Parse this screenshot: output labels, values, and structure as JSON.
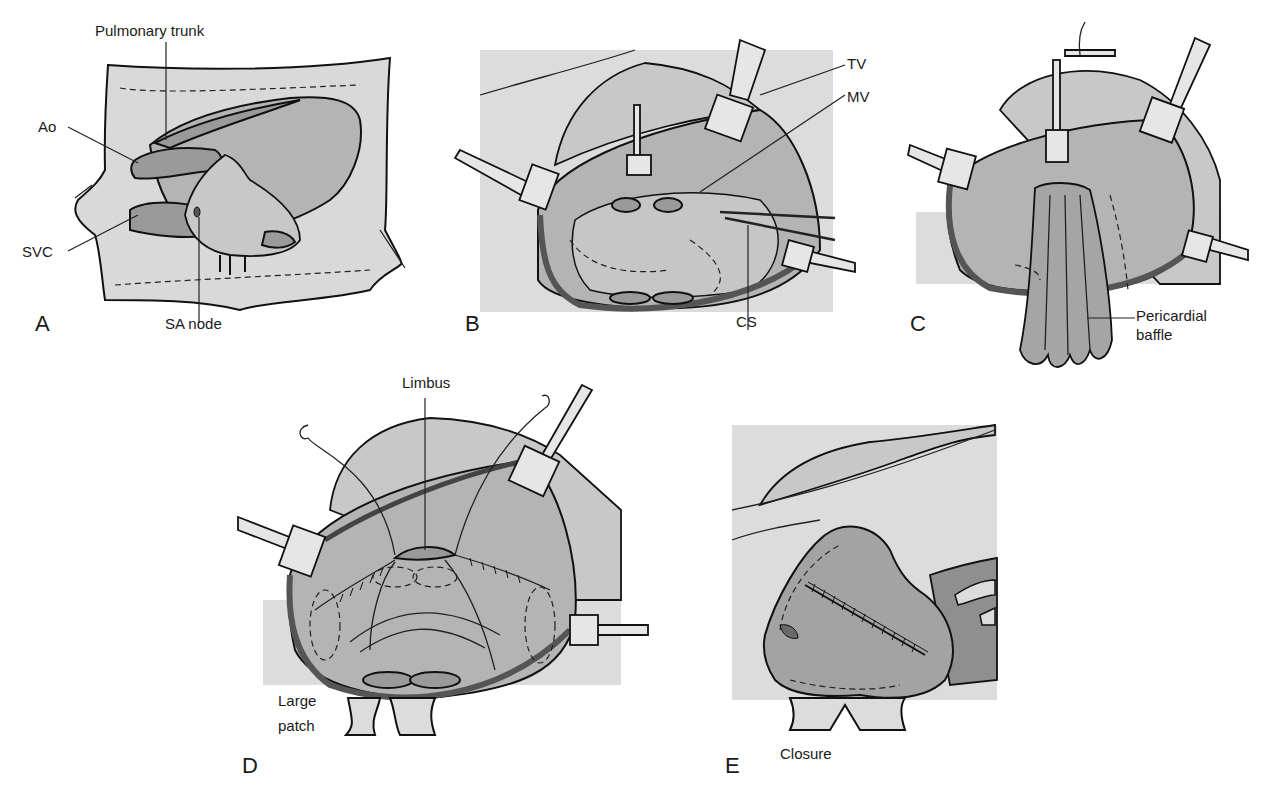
{
  "figure": {
    "background": "#ffffff",
    "tissue_color": "#d9d9d9",
    "heart_color": "#a8a8a8"
  },
  "panels": [
    {
      "id": "A",
      "letter": "A",
      "labels": {
        "pulmonary_trunk": "Pulmonary trunk",
        "ao": "Ao",
        "svc": "SVC",
        "sa_node": "SA node"
      }
    },
    {
      "id": "B",
      "letter": "B",
      "labels": {
        "tv": "TV",
        "mv": "MV",
        "cs": "CS"
      }
    },
    {
      "id": "C",
      "letter": "C",
      "labels": {
        "pericardial_baffle_line1": "Pericardial",
        "pericardial_baffle_line2": "baffle"
      }
    },
    {
      "id": "D",
      "letter": "D",
      "labels": {
        "limbus": "Limbus",
        "large_patch_line1": "Large",
        "large_patch_line2": "patch"
      }
    },
    {
      "id": "E",
      "letter": "E",
      "labels": {
        "closure": "Closure"
      }
    }
  ]
}
